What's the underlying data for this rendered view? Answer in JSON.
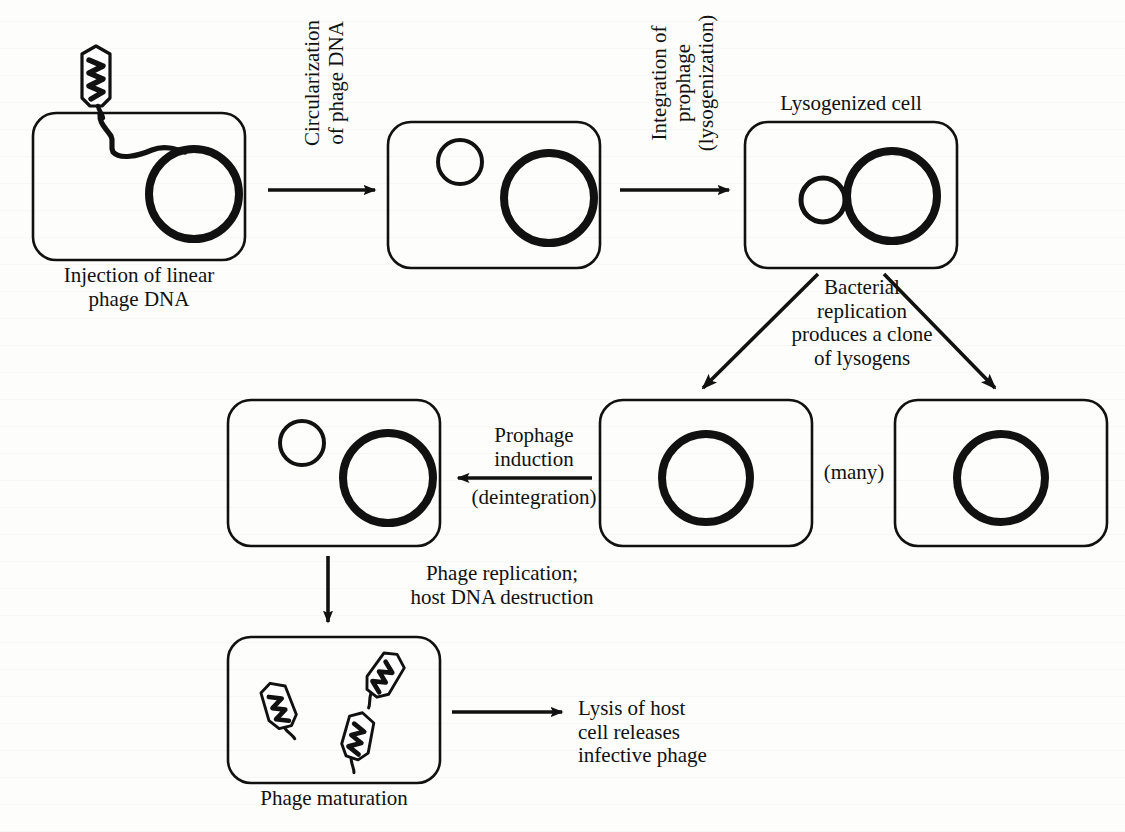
{
  "diagram": {
    "background_color": "#fdfdfb",
    "line_color": "#111111"
  },
  "captions": {
    "injection": "Injection of linear\nphage DNA",
    "lysogenized_cell": "Lysogenized cell",
    "phage_maturation": "Phage maturation",
    "many": "(many)"
  },
  "arrow_labels": {
    "circularization": "Circularization\nof phage DNA",
    "integration": "Integration of\nprophage\n(lysogenization)",
    "bacterial_replication": "Bacterial\nreplication\nproduces a clone\nof lysogens",
    "prophage_induction": "Prophage\ninduction",
    "deintegration": "(deintegration)",
    "phage_replication": "Phage replication;\nhost DNA destruction",
    "lysis": "Lysis of host\ncell releases\ninfective phage"
  },
  "cells": [
    {
      "id": "cell-injection",
      "name": "cell-injection-of-linear-phage-dna",
      "x": 33,
      "y": 113,
      "w": 212,
      "h": 147,
      "contents": [
        "bacterial-chromosome-thick-circle",
        "linear-phage-dna-strand"
      ],
      "chromosome": {
        "cx": 194,
        "cy": 194,
        "r": 45,
        "stroke": 8
      }
    },
    {
      "id": "cell-circularized",
      "name": "cell-with-circularized-phage-dna",
      "x": 388,
      "y": 122,
      "w": 212,
      "h": 146,
      "contents": [
        "phage-dna-small-thin-circle",
        "bacterial-chromosome-thick-circle"
      ],
      "small_circle": {
        "cx": 460,
        "cy": 162,
        "r": 22,
        "stroke": 4
      },
      "chromosome": {
        "cx": 549,
        "cy": 198,
        "r": 45,
        "stroke": 8
      }
    },
    {
      "id": "cell-lysogenized",
      "name": "cell-lysogenized",
      "x": 745,
      "y": 122,
      "w": 212,
      "h": 146,
      "contents": [
        "prophage-small-circle-integrated",
        "bacterial-chromosome-thick-circle"
      ],
      "small_circle": {
        "cx": 823,
        "cy": 200,
        "r": 22,
        "stroke": 5
      },
      "chromosome": {
        "cx": 892,
        "cy": 196,
        "r": 45,
        "stroke": 8
      }
    },
    {
      "id": "cell-lysogen-1",
      "name": "cell-lysogen-clone-left",
      "x": 600,
      "y": 400,
      "w": 212,
      "h": 146,
      "contents": [
        "bacterial-chromosome-with-prophage"
      ],
      "chromosome": {
        "cx": 706,
        "cy": 478,
        "r": 44,
        "stroke": 8
      }
    },
    {
      "id": "cell-lysogen-2",
      "name": "cell-lysogen-clone-right",
      "x": 895,
      "y": 400,
      "w": 212,
      "h": 146,
      "contents": [
        "bacterial-chromosome-with-prophage"
      ],
      "chromosome": {
        "cx": 1001,
        "cy": 478,
        "r": 44,
        "stroke": 8
      }
    },
    {
      "id": "cell-induced",
      "name": "cell-after-prophage-induction",
      "x": 228,
      "y": 400,
      "w": 212,
      "h": 146,
      "contents": [
        "excised-phage-dna-small-circle",
        "bacterial-chromosome-thick-circle"
      ],
      "small_circle": {
        "cx": 302,
        "cy": 443,
        "r": 22,
        "stroke": 4
      },
      "chromosome": {
        "cx": 388,
        "cy": 478,
        "r": 45,
        "stroke": 8
      }
    },
    {
      "id": "cell-maturation",
      "name": "cell-phage-maturation",
      "x": 228,
      "y": 637,
      "w": 212,
      "h": 146,
      "contents": [
        "mature-phage-particle",
        "mature-phage-particle",
        "mature-phage-particle"
      ]
    }
  ],
  "phage_particles": [
    {
      "name": "phage-injecting",
      "cx": 96,
      "cy": 84,
      "rotation": 0,
      "scale": 1.0
    },
    {
      "name": "mature-phage-left",
      "cx": 281,
      "cy": 711,
      "rotation": -18,
      "scale": 0.92
    },
    {
      "name": "mature-phage-top-right",
      "cx": 382,
      "cy": 680,
      "rotation": 34,
      "scale": 0.92
    },
    {
      "name": "mature-phage-bottom",
      "cx": 357,
      "cy": 742,
      "rotation": 12,
      "scale": 0.92
    }
  ],
  "arrows": [
    {
      "name": "arrow-circularization",
      "x1": 268,
      "y1": 190,
      "x2": 381,
      "y2": 190,
      "type": "straight-right"
    },
    {
      "name": "arrow-integration",
      "x1": 620,
      "y1": 190,
      "x2": 735,
      "y2": 190,
      "type": "straight-right"
    },
    {
      "name": "arrow-replication-left",
      "x1": 812,
      "y1": 272,
      "x2": 700,
      "y2": 392,
      "type": "diagonal-down-left"
    },
    {
      "name": "arrow-replication-right",
      "x1": 885,
      "y1": 272,
      "x2": 998,
      "y2": 392,
      "type": "diagonal-down-right"
    },
    {
      "name": "arrow-prophage-induction",
      "x1": 592,
      "y1": 478,
      "x2": 452,
      "y2": 478,
      "type": "straight-left"
    },
    {
      "name": "arrow-phage-replication",
      "x1": 328,
      "y1": 556,
      "x2": 328,
      "y2": 628,
      "type": "straight-down"
    },
    {
      "name": "arrow-lysis",
      "x1": 452,
      "y1": 712,
      "x2": 568,
      "y2": 712,
      "type": "straight-right"
    }
  ]
}
